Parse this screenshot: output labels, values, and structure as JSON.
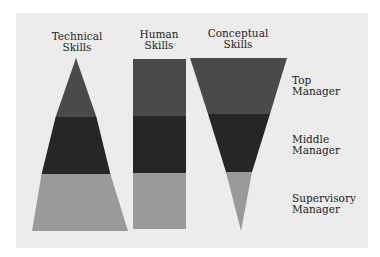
{
  "columns": [
    {
      "title_line1": "Technical",
      "title_line2": "Skills",
      "shape": "triangle-up"
    },
    {
      "title_line1": "Human",
      "title_line2": "Skills",
      "shape": "rectangle"
    },
    {
      "title_line1": "Conceptual",
      "title_line2": "Skills",
      "shape": "triangle-down"
    }
  ],
  "rows": [
    {
      "line1": "Top",
      "line2": "Manager",
      "color": "#4a4a4a"
    },
    {
      "line1": "Middle",
      "line2": "Manager",
      "color": "#262626"
    },
    {
      "line1": "Supervisory",
      "line2": "Manager",
      "color": "#9a9a9a"
    }
  ],
  "colors": {
    "background": "#ececec",
    "top": "#4a4a4a",
    "middle": "#262626",
    "supervisory": "#9a9a9a"
  }
}
